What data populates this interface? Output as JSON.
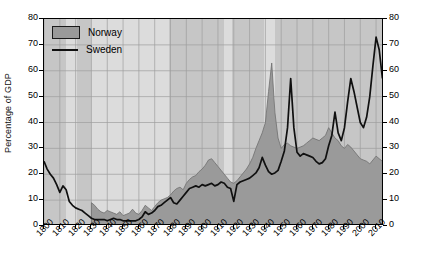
{
  "chart_data": {
    "type": "area",
    "title": "",
    "xlabel": "",
    "ylabel": "Percentage of GDP",
    "xlim": [
      1800,
      2015
    ],
    "ylim": [
      0,
      80
    ],
    "yticks": [
      0,
      10,
      20,
      30,
      40,
      50,
      60,
      70,
      80
    ],
    "yticks_right": [
      0,
      10,
      20,
      30,
      40,
      50,
      60,
      70,
      80
    ],
    "xticks": [
      1800,
      1810,
      1820,
      1830,
      1840,
      1850,
      1860,
      1870,
      1880,
      1890,
      1900,
      1910,
      1920,
      1930,
      1940,
      1950,
      1960,
      1970,
      1980,
      1990,
      2000,
      2010
    ],
    "xtick_labels": [
      "1800",
      "1810",
      "1820",
      "1830",
      "1840",
      "1850",
      "1860",
      "1870",
      "1880",
      "1890",
      "1900",
      "1910",
      "1920",
      "1930",
      "1940",
      "1950",
      "1960",
      "1970",
      "1980",
      "1990",
      "2000",
      "2010"
    ],
    "grid": true,
    "legend_position": "top-left",
    "legend": [
      {
        "name": "Norway",
        "style": "filled-area",
        "color": "#9a9a9a"
      },
      {
        "name": "Sweden",
        "style": "line",
        "color": "#101010"
      }
    ],
    "background_bands": [
      {
        "from": 1800,
        "to": 1814,
        "shade": "dark"
      },
      {
        "from": 1814,
        "to": 1821,
        "shade": "light"
      },
      {
        "from": 1821,
        "to": 1830,
        "shade": "dark"
      },
      {
        "from": 1830,
        "to": 1879,
        "shade": "light"
      },
      {
        "from": 1879,
        "to": 1914,
        "shade": "dark"
      },
      {
        "from": 1914,
        "to": 1919,
        "shade": "light"
      },
      {
        "from": 1919,
        "to": 1939,
        "shade": "dark"
      },
      {
        "from": 1939,
        "to": 1946,
        "shade": "light"
      },
      {
        "from": 1946,
        "to": 2015,
        "shade": "dark"
      }
    ],
    "series": [
      {
        "name": "Norway",
        "type": "area",
        "x": [
          1830,
          1832,
          1834,
          1836,
          1838,
          1840,
          1842,
          1844,
          1846,
          1848,
          1850,
          1852,
          1854,
          1856,
          1858,
          1860,
          1862,
          1864,
          1866,
          1868,
          1870,
          1872,
          1874,
          1876,
          1878,
          1880,
          1882,
          1884,
          1886,
          1888,
          1890,
          1892,
          1894,
          1896,
          1898,
          1900,
          1902,
          1904,
          1906,
          1908,
          1910,
          1912,
          1914,
          1916,
          1918,
          1920,
          1922,
          1924,
          1926,
          1928,
          1930,
          1932,
          1934,
          1936,
          1938,
          1940,
          1942,
          1944,
          1946,
          1948,
          1950,
          1952,
          1954,
          1956,
          1958,
          1960,
          1962,
          1964,
          1966,
          1968,
          1970,
          1972,
          1974,
          1976,
          1978,
          1980,
          1982,
          1984,
          1986,
          1988,
          1990,
          1992,
          1994,
          1996,
          1998,
          2000,
          2002,
          2004,
          2006,
          2008,
          2010,
          2012,
          2014
        ],
        "y": [
          9.0,
          8.0,
          6.5,
          5.5,
          5.0,
          6.0,
          5.5,
          5.0,
          4.5,
          5.5,
          4.0,
          4.5,
          5.0,
          6.5,
          5.0,
          4.5,
          6.0,
          8.0,
          7.0,
          6.0,
          7.5,
          9.0,
          10.0,
          10.5,
          11.0,
          12.0,
          13.5,
          14.5,
          15.0,
          14.0,
          16.5,
          18.0,
          19.0,
          19.5,
          21.0,
          22.0,
          23.5,
          25.5,
          26.0,
          24.5,
          23.0,
          21.5,
          20.0,
          18.5,
          17.0,
          16.5,
          17.5,
          19.0,
          20.5,
          22.0,
          24.0,
          26.5,
          30.0,
          33.0,
          36.0,
          40.0,
          52.0,
          63.0,
          44.0,
          34.0,
          30.0,
          31.5,
          32.0,
          31.0,
          30.5,
          30.0,
          30.5,
          31.0,
          32.0,
          33.0,
          34.0,
          33.5,
          33.0,
          34.0,
          35.0,
          38.0,
          36.0,
          34.0,
          33.0,
          31.0,
          30.0,
          31.5,
          30.5,
          29.0,
          27.5,
          26.0,
          25.5,
          25.0,
          24.0,
          25.5,
          27.0,
          26.0,
          25.0
        ]
      },
      {
        "name": "Sweden",
        "type": "line",
        "x": [
          1800,
          1802,
          1804,
          1806,
          1808,
          1810,
          1812,
          1814,
          1816,
          1818,
          1820,
          1822,
          1824,
          1826,
          1828,
          1830,
          1832,
          1834,
          1836,
          1838,
          1840,
          1842,
          1844,
          1846,
          1848,
          1850,
          1852,
          1854,
          1856,
          1858,
          1860,
          1862,
          1864,
          1866,
          1868,
          1870,
          1872,
          1874,
          1876,
          1878,
          1880,
          1882,
          1884,
          1886,
          1888,
          1890,
          1892,
          1894,
          1896,
          1898,
          1900,
          1902,
          1904,
          1906,
          1908,
          1910,
          1912,
          1914,
          1916,
          1918,
          1920,
          1922,
          1924,
          1926,
          1928,
          1930,
          1932,
          1934,
          1936,
          1938,
          1940,
          1942,
          1944,
          1946,
          1948,
          1950,
          1952,
          1954,
          1956,
          1958,
          1960,
          1962,
          1964,
          1966,
          1968,
          1970,
          1972,
          1974,
          1976,
          1978,
          1980,
          1982,
          1984,
          1986,
          1988,
          1990,
          1992,
          1994,
          1996,
          1998,
          2000,
          2002,
          2004,
          2006,
          2008,
          2010,
          2012,
          2014
        ],
        "y": [
          25.0,
          22.0,
          20.0,
          18.5,
          16.0,
          13.0,
          15.5,
          14.0,
          9.5,
          8.0,
          7.0,
          6.5,
          6.0,
          5.0,
          4.0,
          3.0,
          2.5,
          2.5,
          2.5,
          2.5,
          2.0,
          2.5,
          3.0,
          2.5,
          2.5,
          2.0,
          2.0,
          2.0,
          2.0,
          2.0,
          2.5,
          3.5,
          5.5,
          4.5,
          5.0,
          6.0,
          7.5,
          8.0,
          9.0,
          10.0,
          11.0,
          9.0,
          8.5,
          10.0,
          11.5,
          13.0,
          14.5,
          15.0,
          15.5,
          15.0,
          16.0,
          15.5,
          16.0,
          16.5,
          15.5,
          16.0,
          17.0,
          16.5,
          15.0,
          14.5,
          9.5,
          16.0,
          17.0,
          17.5,
          18.0,
          18.5,
          19.5,
          20.5,
          22.5,
          26.5,
          23.5,
          21.0,
          20.0,
          20.5,
          21.5,
          25.0,
          29.0,
          38.0,
          57.0,
          38.0,
          28.5,
          27.0,
          28.0,
          27.5,
          27.0,
          26.5,
          25.0,
          24.0,
          24.5,
          26.0,
          31.0,
          35.0,
          44.0,
          36.0,
          33.0,
          38.0,
          48.0,
          57.0,
          52.0,
          46.0,
          40.0,
          38.0,
          42.0,
          50.0,
          62.0,
          73.0,
          68.0,
          57.0
        ]
      }
    ]
  }
}
